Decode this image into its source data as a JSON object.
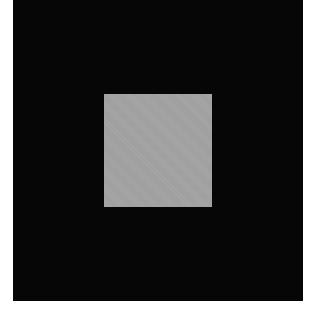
{
  "image": {
    "description": "Black square field with a centered mid-gray square",
    "background_color": "#ffffff",
    "outer_square": {
      "color": "#060606",
      "x": 13,
      "y": 0,
      "width": 290,
      "height": 301
    },
    "inner_square": {
      "color": "#a3a3a3",
      "x": 104,
      "y": 94,
      "width": 108,
      "height": 113
    }
  }
}
